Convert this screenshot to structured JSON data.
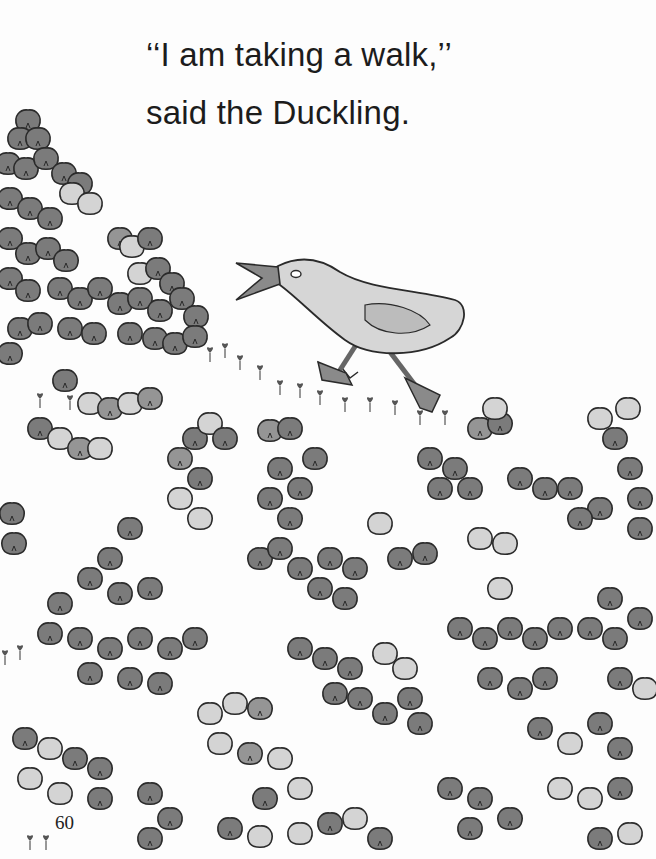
{
  "page": {
    "text_lines": [
      "‘‘I am taking a walk,’’",
      "said the Duckling."
    ],
    "page_number": "60"
  },
  "illustration": {
    "subject": "duckling walking through a field of clover",
    "elements": [
      "duckling",
      "clover-field",
      "sprouts"
    ],
    "colors": {
      "dark_leaf": "#7b7b7b",
      "mid_leaf": "#959595",
      "light_leaf": "#d4d4d4",
      "outline": "#2a2a2a",
      "duck_body": "#d6d6d6",
      "duck_beak": "#8a8a8a",
      "background": "#fdfdfd"
    }
  }
}
